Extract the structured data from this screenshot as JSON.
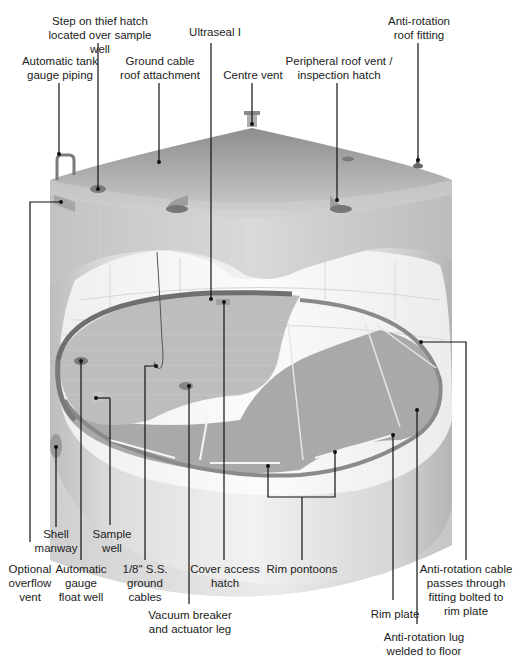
{
  "diagram": {
    "labels": {
      "step_on_thief_hatch": "Step on thief hatch\nlocated over sample well",
      "ultraseal": "Ultraseal I",
      "anti_rotation_roof_fitting": "Anti-rotation\nroof fitting",
      "automatic_tank_gauge_piping": "Automatic tank\ngauge piping",
      "ground_cable_roof_attachment": "Ground cable\nroof attachment",
      "centre_vent": "Centre vent",
      "peripheral_roof_vent": "Peripheral roof vent /\ninspection hatch",
      "shell_manway": "Shell\nmanway",
      "sample_well": "Sample\nwell",
      "optional_overflow_vent": "Optional\noverflow\nvent",
      "automatic_gauge_float_well": "Automatic\ngauge\nfloat well",
      "ground_cables": "1/8\" S.S.\nground\ncables",
      "cover_access_hatch": "Cover access\nhatch",
      "rim_pontoons": "Rim pontoons",
      "vacuum_breaker": "Vacuum breaker\nand actuator leg",
      "rim_plate": "Rim plate",
      "anti_rotation_cable": "Anti-rotation cable\npasses through\nfitting bolted to\nrim plate",
      "anti_rotation_lug": "Anti-rotation lug\nwelded to floor"
    },
    "colors": {
      "tank_light": "#e8e8e8",
      "tank_mid": "#c8c8c8",
      "tank_dark": "#9a9a9a",
      "floor": "#a8a8a8",
      "seal": "#7a7a7a",
      "leader": "#111111"
    }
  }
}
